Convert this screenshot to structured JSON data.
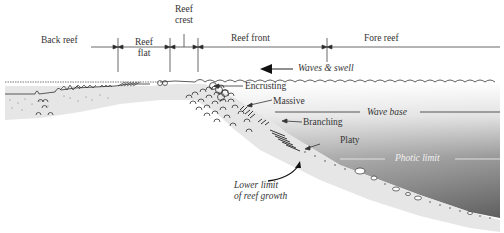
{
  "diagram": {
    "zones": [
      {
        "id": "back-reef",
        "label": "Back reef"
      },
      {
        "id": "reef-flat",
        "label_line1": "Reef",
        "label_line2": "flat"
      },
      {
        "id": "reef-crest",
        "label_line1": "Reef",
        "label_line2": "crest"
      },
      {
        "id": "reef-front",
        "label": "Reef front"
      },
      {
        "id": "fore-reef",
        "label": "Fore reef"
      }
    ],
    "waves_label": "Waves & swell",
    "coral_forms": [
      {
        "id": "encrusting",
        "label": "Encrusting"
      },
      {
        "id": "massive",
        "label": "Massive"
      },
      {
        "id": "branching",
        "label": "Branching"
      },
      {
        "id": "platy",
        "label": "Platy"
      }
    ],
    "depth_lines": {
      "wave_base": "Wave base",
      "photic_limit": "Photic limit"
    },
    "lower_limit": {
      "line1": "Lower limit",
      "line2": "of reef growth"
    },
    "colors": {
      "water_light": "#f4f4f4",
      "water_dark": "#6a6a6a",
      "sediment": "#e6e6e6",
      "line": "#333333"
    }
  }
}
